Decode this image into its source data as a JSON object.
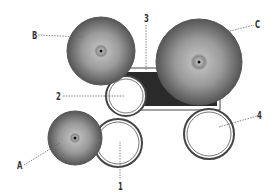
{
  "diagram": {
    "colors": {
      "cymbal_dark": "#555555",
      "cymbal_light": "#bdbdbd",
      "bass_drum": "#2a2a2a",
      "drum_rim": "#444444",
      "leader": "#666666"
    },
    "labels": {
      "A": "A",
      "B": "B",
      "C": "C",
      "n1": "1",
      "n2": "2",
      "n3": "3",
      "n4": "4"
    },
    "parts": [
      {
        "key": "A",
        "type": "cymbal"
      },
      {
        "key": "B",
        "type": "cymbal"
      },
      {
        "key": "C",
        "type": "cymbal"
      },
      {
        "key": "1",
        "type": "drum"
      },
      {
        "key": "2",
        "type": "drum"
      },
      {
        "key": "3",
        "type": "bass-drum"
      },
      {
        "key": "4",
        "type": "drum"
      }
    ]
  }
}
